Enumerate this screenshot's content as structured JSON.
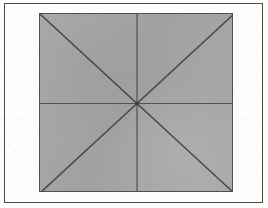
{
  "page": {
    "background_color": "#fdfdfc",
    "width": 268,
    "height": 208
  },
  "outer_frame": {
    "name": "page-border",
    "stroke_color": "#4a4a4a",
    "stroke_width": 1,
    "x": 4,
    "y": 3,
    "width": 259,
    "height": 200
  },
  "figure": {
    "shape": "square",
    "fill_color": "#a6a6a6",
    "stroke_color": "#4f4f4f",
    "stroke_width": 1,
    "x": 39,
    "y": 13,
    "width": 194,
    "height": 179,
    "center": {
      "x": 97,
      "y": 89.5
    },
    "lines": [
      {
        "name": "horizontal-median",
        "kind": "median",
        "x1": 0,
        "y1": 89.5,
        "x2": 194,
        "y2": 89.5
      },
      {
        "name": "vertical-median",
        "kind": "median",
        "x1": 97,
        "y1": 0,
        "x2": 97,
        "y2": 179
      },
      {
        "name": "diagonal-tl-br",
        "kind": "diagonal",
        "x1": 0,
        "y1": 0,
        "x2": 194,
        "y2": 179
      },
      {
        "name": "diagonal-tr-bl",
        "kind": "diagonal",
        "x1": 194,
        "y1": 0,
        "x2": 0,
        "y2": 179
      }
    ],
    "center_marker": {
      "name": "center-intersection",
      "r": 1.6,
      "color": "#3a3a3a"
    }
  }
}
